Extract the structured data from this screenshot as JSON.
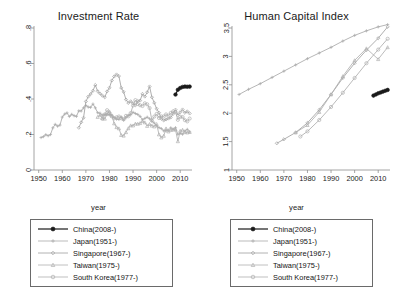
{
  "figure": {
    "panels": [
      {
        "id": "investment-rate",
        "title": "Investment Rate"
      },
      {
        "id": "human-capital-index",
        "title": "Human Capital Index"
      }
    ],
    "xlabel": "year",
    "legend_entries": [
      {
        "label": "China(2008-)",
        "color": "#1a1a1a",
        "marker": "circle-filled"
      },
      {
        "label": "Japan(1951-)",
        "color": "#a9a9a9",
        "marker": "plus"
      },
      {
        "label": "Singapore(1967-)",
        "color": "#a0a0a0",
        "marker": "diamond"
      },
      {
        "label": "Taiwan(1975-)",
        "color": "#b0b0b0",
        "marker": "triangle"
      },
      {
        "label": "South Korea(1977-)",
        "color": "#aeaeae",
        "marker": "circle-open"
      }
    ]
  },
  "chart_data": [
    {
      "type": "line",
      "title": "Investment Rate",
      "xlabel": "year",
      "ylabel": "",
      "xlim": [
        1948,
        2015
      ],
      "ylim": [
        0,
        0.8
      ],
      "xticks": [
        1950,
        1960,
        1970,
        1980,
        1990,
        2000,
        2010
      ],
      "yticks": [
        0,
        0.2,
        0.4,
        0.6,
        0.8
      ],
      "ytick_labels": [
        "0",
        ".2",
        ".4",
        ".6",
        ".8"
      ],
      "grid": false,
      "legend_position": "below",
      "series": [
        {
          "name": "China(2008-)",
          "color": "#1a1a1a",
          "marker": "circle-filled",
          "x": [
            2008,
            2009,
            2010,
            2011,
            2012,
            2013,
            2014
          ],
          "y": [
            0.425,
            0.452,
            0.462,
            0.468,
            0.47,
            0.469,
            0.47
          ]
        },
        {
          "name": "Japan(1951-)",
          "color": "#a9a9a9",
          "marker": "plus",
          "x": [
            1951,
            1952,
            1953,
            1954,
            1955,
            1956,
            1957,
            1958,
            1959,
            1960,
            1961,
            1962,
            1963,
            1964,
            1965,
            1966,
            1967,
            1968,
            1969,
            1970,
            1971,
            1972,
            1973,
            1974,
            1975,
            1976,
            1977,
            1978,
            1979,
            1980,
            1981,
            1982,
            1983,
            1984,
            1985,
            1986,
            1987,
            1988,
            1989,
            1990,
            1991,
            1992,
            1993,
            1994,
            1995,
            1996,
            1997,
            1998,
            1999,
            2000,
            2001,
            2002,
            2003,
            2004,
            2005,
            2006,
            2007,
            2008,
            2009,
            2010,
            2011,
            2012,
            2013,
            2014
          ],
          "y": [
            0.175,
            0.19,
            0.205,
            0.2,
            0.205,
            0.235,
            0.25,
            0.245,
            0.26,
            0.29,
            0.32,
            0.315,
            0.31,
            0.32,
            0.305,
            0.31,
            0.33,
            0.34,
            0.35,
            0.365,
            0.35,
            0.35,
            0.365,
            0.35,
            0.325,
            0.32,
            0.31,
            0.31,
            0.315,
            0.315,
            0.31,
            0.3,
            0.29,
            0.29,
            0.29,
            0.285,
            0.29,
            0.305,
            0.32,
            0.33,
            0.325,
            0.31,
            0.295,
            0.285,
            0.285,
            0.29,
            0.285,
            0.265,
            0.255,
            0.255,
            0.245,
            0.23,
            0.23,
            0.23,
            0.23,
            0.235,
            0.235,
            0.23,
            0.205,
            0.205,
            0.21,
            0.215,
            0.22,
            0.225
          ]
        },
        {
          "name": "Singapore(1967-)",
          "color": "#a0a0a0",
          "marker": "diamond",
          "x": [
            1967,
            1968,
            1969,
            1970,
            1971,
            1972,
            1973,
            1974,
            1975,
            1976,
            1977,
            1978,
            1979,
            1980,
            1981,
            1982,
            1983,
            1984,
            1985,
            1986,
            1987,
            1988,
            1989,
            1990,
            1991,
            1992,
            1993,
            1994,
            1995,
            1996,
            1997,
            1998,
            1999,
            2000,
            2001,
            2002,
            2003,
            2004,
            2005,
            2006,
            2007,
            2008,
            2009,
            2010,
            2011,
            2012,
            2013,
            2014
          ],
          "y": [
            0.23,
            0.265,
            0.3,
            0.385,
            0.42,
            0.43,
            0.455,
            0.47,
            0.44,
            0.42,
            0.41,
            0.42,
            0.435,
            0.47,
            0.5,
            0.53,
            0.54,
            0.52,
            0.47,
            0.43,
            0.4,
            0.385,
            0.38,
            0.375,
            0.375,
            0.38,
            0.4,
            0.42,
            0.42,
            0.44,
            0.47,
            0.42,
            0.37,
            0.35,
            0.33,
            0.3,
            0.29,
            0.29,
            0.29,
            0.3,
            0.32,
            0.34,
            0.32,
            0.32,
            0.33,
            0.33,
            0.32,
            0.31
          ]
        },
        {
          "name": "Taiwan(1975-)",
          "color": "#b0b0b0",
          "marker": "triangle",
          "x": [
            1975,
            1976,
            1977,
            1978,
            1979,
            1980,
            1981,
            1982,
            1983,
            1984,
            1985,
            1986,
            1987,
            1988,
            1989,
            1990,
            1991,
            1992,
            1993,
            1994,
            1995,
            1996,
            1997,
            1998,
            1999,
            2000,
            2001,
            2002,
            2003,
            2004,
            2005,
            2006,
            2007,
            2008,
            2009,
            2010,
            2011,
            2012,
            2013,
            2014
          ],
          "y": [
            0.29,
            0.3,
            0.285,
            0.295,
            0.32,
            0.33,
            0.3,
            0.26,
            0.24,
            0.225,
            0.2,
            0.185,
            0.205,
            0.23,
            0.24,
            0.24,
            0.25,
            0.265,
            0.27,
            0.265,
            0.26,
            0.24,
            0.25,
            0.26,
            0.25,
            0.25,
            0.195,
            0.19,
            0.2,
            0.23,
            0.225,
            0.225,
            0.225,
            0.22,
            0.17,
            0.22,
            0.23,
            0.215,
            0.215,
            0.215
          ]
        },
        {
          "name": "South Korea(1977-)",
          "color": "#aeaeae",
          "marker": "circle-open",
          "x": [
            1977,
            1978,
            1979,
            1980,
            1981,
            1982,
            1983,
            1984,
            1985,
            1986,
            1987,
            1988,
            1989,
            1990,
            1991,
            1992,
            1993,
            1994,
            1995,
            1996,
            1997,
            1998,
            1999,
            2000,
            2001,
            2002,
            2003,
            2004,
            2005,
            2006,
            2007,
            2008,
            2009,
            2010,
            2011,
            2012,
            2013,
            2014
          ],
          "y": [
            0.28,
            0.32,
            0.33,
            0.32,
            0.3,
            0.3,
            0.3,
            0.305,
            0.3,
            0.295,
            0.3,
            0.31,
            0.33,
            0.37,
            0.39,
            0.375,
            0.36,
            0.365,
            0.37,
            0.38,
            0.355,
            0.275,
            0.29,
            0.31,
            0.3,
            0.3,
            0.31,
            0.31,
            0.31,
            0.32,
            0.33,
            0.33,
            0.29,
            0.3,
            0.3,
            0.285,
            0.28,
            0.29
          ]
        }
      ]
    },
    {
      "type": "line",
      "title": "Human Capital Index",
      "xlabel": "year",
      "ylabel": "",
      "xlim": [
        1948,
        2015
      ],
      "ylim": [
        1,
        3.5
      ],
      "xticks": [
        1950,
        1960,
        1970,
        1980,
        1990,
        2000,
        2010
      ],
      "yticks": [
        1,
        1.5,
        2,
        2.5,
        3,
        3.5
      ],
      "ytick_labels": [
        "1",
        "1.5",
        "2",
        "2.5",
        "3",
        "3.5"
      ],
      "grid": false,
      "legend_position": "below",
      "series": [
        {
          "name": "China(2008-)",
          "color": "#1a1a1a",
          "marker": "circle-filled",
          "x": [
            2008,
            2009,
            2010,
            2011,
            2012,
            2013,
            2014
          ],
          "y": [
            2.31,
            2.33,
            2.35,
            2.365,
            2.38,
            2.395,
            2.41
          ]
        },
        {
          "name": "Japan(1951-)",
          "color": "#a9a9a9",
          "marker": "plus",
          "x": [
            1951,
            1955,
            1960,
            1965,
            1970,
            1975,
            1980,
            1985,
            1990,
            1995,
            2000,
            2005,
            2010,
            2014
          ],
          "y": [
            2.33,
            2.42,
            2.52,
            2.63,
            2.74,
            2.85,
            2.96,
            3.06,
            3.16,
            3.27,
            3.37,
            3.45,
            3.52,
            3.56
          ]
        },
        {
          "name": "Singapore(1967-)",
          "color": "#a0a0a0",
          "marker": "diamond",
          "x": [
            1967,
            1970,
            1975,
            1980,
            1985,
            1990,
            1995,
            2000,
            2005,
            2010,
            2014
          ],
          "y": [
            1.47,
            1.54,
            1.66,
            1.83,
            2.06,
            2.33,
            2.62,
            2.88,
            3.11,
            3.32,
            3.52
          ]
        },
        {
          "name": "Taiwan(1975-)",
          "color": "#b0b0b0",
          "marker": "triangle",
          "x": [
            1975,
            1980,
            1985,
            1990,
            1995,
            2000,
            2005,
            2010,
            2014
          ],
          "y": [
            1.66,
            1.79,
            2.02,
            2.33,
            2.65,
            2.93,
            3.14,
            2.95,
            3.16
          ]
        },
        {
          "name": "South Korea(1977-)",
          "color": "#aeaeae",
          "marker": "circle-open",
          "x": [
            1977,
            1980,
            1985,
            1990,
            1995,
            2000,
            2005,
            2010,
            2014
          ],
          "y": [
            1.59,
            1.68,
            1.88,
            2.11,
            2.36,
            2.62,
            2.88,
            3.12,
            3.31
          ]
        }
      ]
    }
  ]
}
